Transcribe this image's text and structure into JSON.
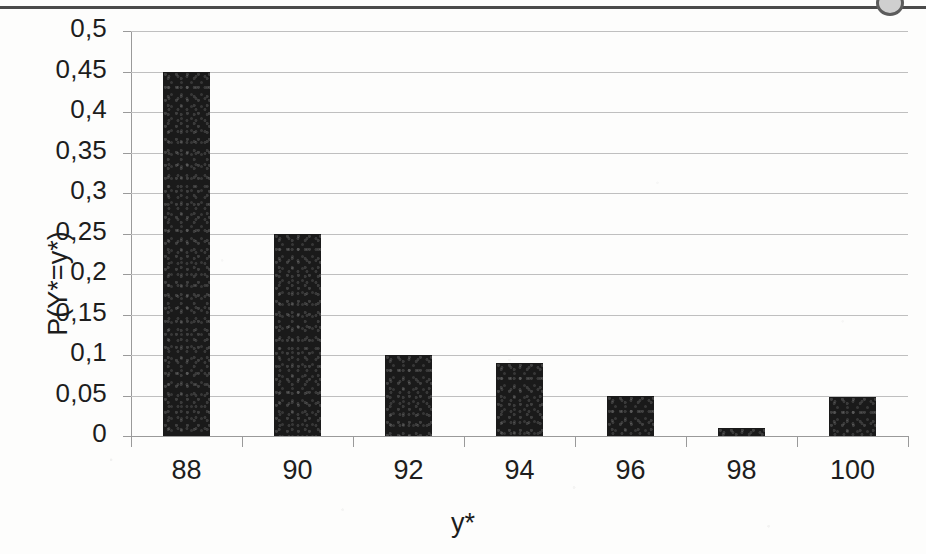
{
  "chart_data": {
    "type": "bar",
    "title": "",
    "xlabel": "y*",
    "ylabel": "P(Y*=y*)",
    "categories": [
      "88",
      "90",
      "92",
      "94",
      "96",
      "98",
      "100"
    ],
    "values": [
      0.45,
      0.25,
      0.1,
      0.09,
      0.05,
      0.01,
      0.048
    ],
    "ylim": [
      0,
      0.5
    ],
    "ytick_labels": [
      "0,5",
      "0,45",
      "0,4",
      "0,35",
      "0,3",
      "0,25",
      "0,2",
      "0,15",
      "0,1",
      "0,05",
      "0"
    ],
    "ytick_values": [
      0.5,
      0.45,
      0.4,
      0.35,
      0.3,
      0.25,
      0.2,
      0.15,
      0.1,
      0.05,
      0
    ],
    "grid": true,
    "legend": "none",
    "bar_color": "#1a1a1a",
    "grid_color": "#bfbfbf",
    "axis_color": "#9a9a9a",
    "text_color": "#1d1d1d",
    "background": "#fdfdfc"
  },
  "artifacts": {
    "top_rule": "",
    "corner_mark": ""
  }
}
